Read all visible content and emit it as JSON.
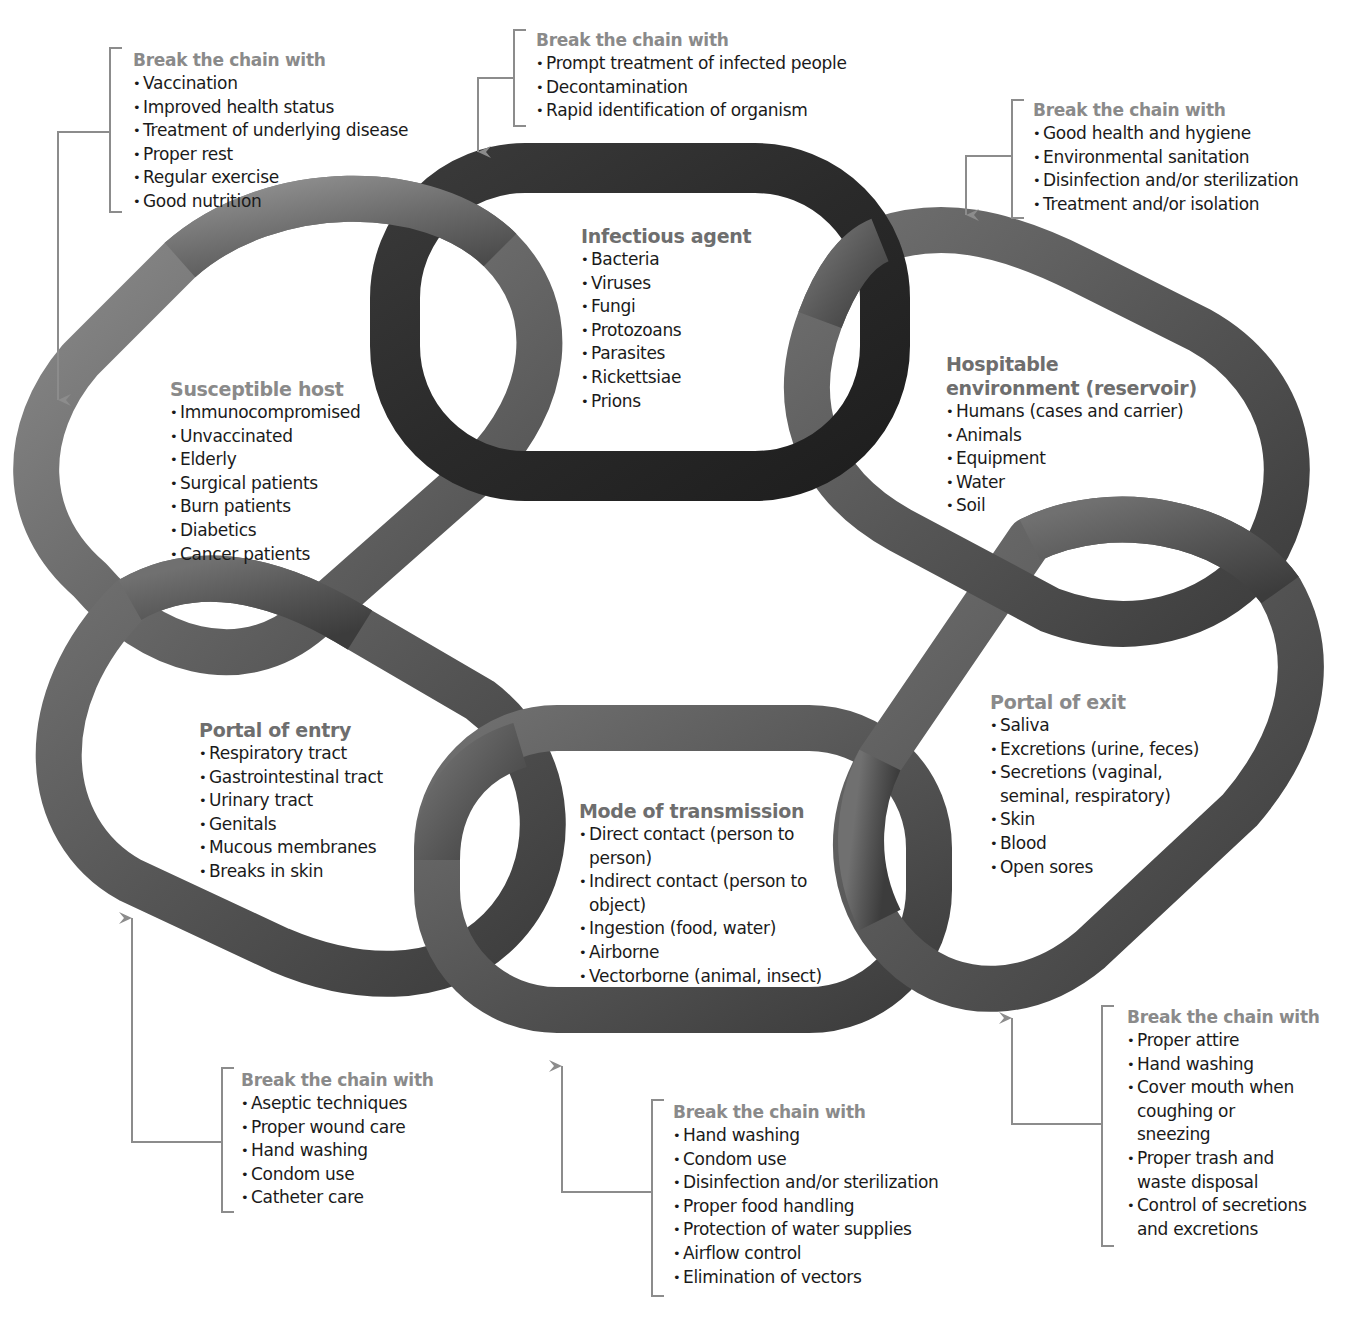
{
  "colors": {
    "ring_dark": "#2e2e2e",
    "ring_mid": "#555555",
    "ring_light": "#7a7a7a",
    "title_gray": "#6e6e6e",
    "break_title_gray": "#8a8a8a",
    "connector_gray": "#8c8c8c",
    "text": "#1a1a1a"
  },
  "links": {
    "infectious_agent": {
      "title": "Infectious agent",
      "items": [
        "Bacteria",
        "Viruses",
        "Fungi",
        "Protozoans",
        "Parasites",
        "Rickettsiae",
        "Prions"
      ]
    },
    "reservoir": {
      "title_line1": "Hospitable",
      "title_line2": "environment (reservoir)",
      "items": [
        "Humans (cases and carrier)",
        "Animals",
        "Equipment",
        "Water",
        "Soil"
      ]
    },
    "portal_of_exit": {
      "title": "Portal of exit",
      "items": [
        "Saliva",
        "Excretions (urine, feces)",
        "Secretions (vaginal,",
        "seminal, respiratory)",
        "Skin",
        "Blood",
        "Open sores"
      ]
    },
    "mode_of_transmission": {
      "title": "Mode of transmission",
      "items": [
        "Direct contact (person to",
        "person)",
        "Indirect contact (person to",
        "object)",
        "Ingestion (food, water)",
        "Airborne",
        "Vectorborne (animal, insect)"
      ]
    },
    "portal_of_entry": {
      "title": "Portal of entry",
      "items": [
        "Respiratory tract",
        "Gastrointestinal tract",
        "Urinary tract",
        "Genitals",
        "Mucous membranes",
        "Breaks in skin"
      ]
    },
    "susceptible_host": {
      "title": "Susceptible host",
      "items": [
        "Immunocompromised",
        "Unvaccinated",
        "Elderly",
        "Surgical patients",
        "Burn patients",
        "Diabetics",
        "Cancer patients"
      ]
    }
  },
  "break_the_chain": {
    "title": "Break the chain with",
    "infectious_agent": [
      "Prompt treatment of infected people",
      "Decontamination",
      "Rapid identification of organism"
    ],
    "reservoir": [
      "Good health and hygiene",
      "Environmental sanitation",
      "Disinfection and/or sterilization",
      "Treatment and/or isolation"
    ],
    "portal_of_exit": [
      "Proper attire",
      "Hand washing",
      "Cover mouth when",
      "coughing or",
      "sneezing",
      "Proper trash and",
      "waste disposal",
      "Control of secretions",
      "and excretions"
    ],
    "mode_of_transmission": [
      "Hand washing",
      "Condom use",
      "Disinfection and/or sterilization",
      "Proper food handling",
      "Protection of water supplies",
      "Airflow control",
      "Elimination of vectors"
    ],
    "portal_of_entry": [
      "Aseptic techniques",
      "Proper wound care",
      "Hand washing",
      "Condom use",
      "Catheter care"
    ],
    "susceptible_host": [
      "Vaccination",
      "Improved health status",
      "Treatment of underlying disease",
      "Proper rest",
      "Regular exercise",
      "Good nutrition"
    ]
  }
}
